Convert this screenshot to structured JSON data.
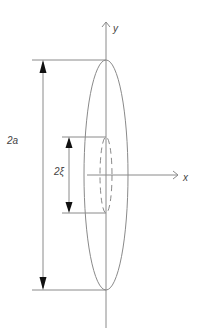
{
  "diagram": {
    "type": "geometry",
    "labels": {
      "y_axis": "y",
      "x_axis": "x",
      "outer_dimension": "2a",
      "inner_dimension": "2ξ"
    },
    "colors": {
      "line": "#8a8a8a",
      "arrow": "#111111",
      "text": "#444444",
      "background": "#ffffff"
    }
  }
}
